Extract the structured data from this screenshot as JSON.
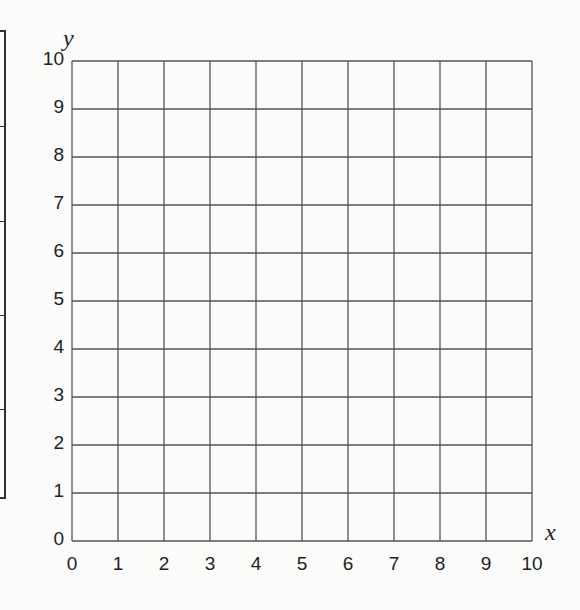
{
  "chart_data": {
    "type": "scatter",
    "title": "",
    "xlabel": "x",
    "ylabel": "y",
    "xlim": [
      0,
      10
    ],
    "ylim": [
      0,
      10
    ],
    "grid": true,
    "x_ticks": [
      "0",
      "1",
      "2",
      "3",
      "4",
      "5",
      "6",
      "7",
      "8",
      "9",
      "10"
    ],
    "y_ticks": [
      "0",
      "1",
      "2",
      "3",
      "4",
      "5",
      "6",
      "7",
      "8",
      "9",
      "10"
    ],
    "series": [],
    "legend": null,
    "note": "Blank coordinate grid (first quadrant, 0-10 on both axes) with no plotted data"
  },
  "layout": {
    "grid_left": 72,
    "grid_top": 61,
    "grid_right": 532,
    "grid_bottom": 541,
    "grid_color": "#555555",
    "left_table_rows": [
      0,
      94,
      189,
      283,
      377,
      469
    ]
  }
}
